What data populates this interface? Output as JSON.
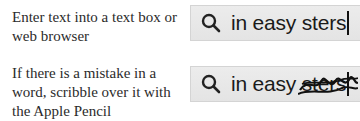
{
  "steps": [
    {
      "instruction": "Enter text into a text box or web browser",
      "search_box": {
        "icon": "search-icon",
        "text": "in easy sters",
        "cursor": true
      }
    },
    {
      "instruction": "If there is a mistake in a word, scribble over it with the Apple Pencil",
      "search_box": {
        "icon": "search-icon",
        "text_plain": "in easy ",
        "text_scribbled": "sters",
        "cursor": true
      }
    }
  ],
  "colors": {
    "box_bg": "#e8e8e8",
    "text": "#1a1a1a",
    "caption": "#2b2b2b"
  }
}
